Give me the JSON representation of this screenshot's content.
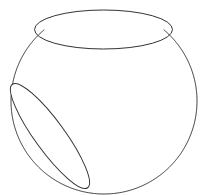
{
  "figure": {
    "stroke_color": "#333333",
    "background": "#ffffff",
    "sphere": {
      "cx": 104,
      "cy": 101,
      "r": 93
    },
    "top_opening": {
      "cx": 103.5,
      "cy": 29.5,
      "rx": 69,
      "ry": 19.5,
      "rotate": 0
    },
    "side_opening": {
      "cx": 50,
      "cy": 136,
      "rx": 64,
      "ry": 15,
      "rotate": 54
    }
  }
}
